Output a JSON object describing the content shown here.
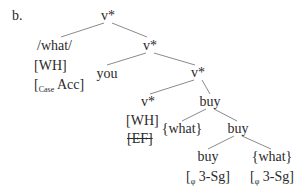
{
  "label": "b.",
  "tree": {
    "root": "v*",
    "spec1": {
      "lines": [
        "/what/",
        "[WH]"
      ],
      "case_open": "[",
      "case_sub": "Case",
      "case_val": "Acc]"
    },
    "v2": "v*",
    "you": "you",
    "v3": "v*",
    "v4": {
      "label": "v*",
      "feat1": "[WH]",
      "feat2": "[EF]"
    },
    "buy1": "buy",
    "what_copy": "{what}",
    "buy2": "buy",
    "buy3": {
      "label": "buy",
      "feat_open": "[",
      "feat_sub": "φ",
      "feat_val": "3-Sg]"
    },
    "what_low": {
      "label": "{what}",
      "feat_open": "[",
      "feat_sub": "φ",
      "feat_val": "3-Sg]"
    }
  }
}
